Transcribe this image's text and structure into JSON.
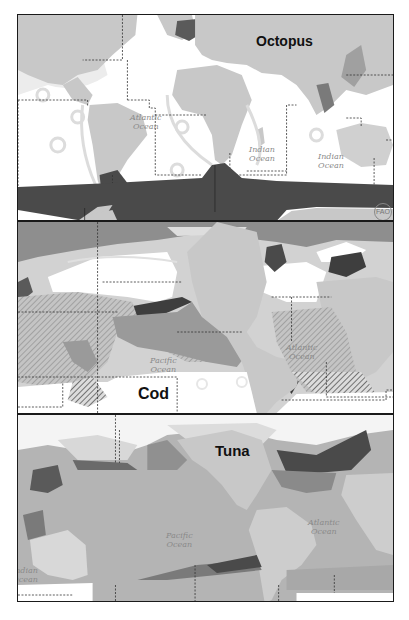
{
  "figure": {
    "panels": [
      {
        "title": "Octopus",
        "ocean_labels": [
          {
            "text": "Atlantic\nOcean",
            "line1": "Atlantic",
            "line2": "Ocean"
          },
          {
            "text": "Indian\nOcean",
            "line1": "Indian",
            "line2": "Ocean"
          },
          {
            "text": "Indian\nOcean",
            "line1": "Indian",
            "line2": "Ocean"
          }
        ],
        "logo": "FAO"
      },
      {
        "title": "Cod",
        "ocean_labels": [
          {
            "line1": "Pacific",
            "line2": "Ocean"
          },
          {
            "line1": "Atlantic",
            "line2": "Ocean"
          }
        ]
      },
      {
        "title": "Tuna",
        "ocean_labels": [
          {
            "line1": "Pacific",
            "line2": "Ocean"
          },
          {
            "line1": "Atlantic",
            "line2": "Ocean"
          },
          {
            "line1": "Indian",
            "line2": "Ocean"
          }
        ]
      }
    ],
    "colors": {
      "land": "#c8c8c8",
      "ocean": "#ffffff",
      "shelf": "#e6e6e6",
      "distribution_dark": "#4a4a4a",
      "distribution_mid": "#9a9a9a",
      "distribution_light": "#b4b4b4",
      "frame": "#1a1a1a"
    }
  }
}
